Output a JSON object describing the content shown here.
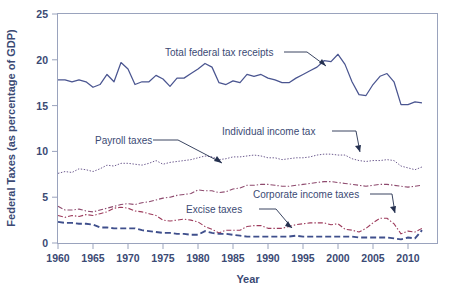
{
  "chart_data": {
    "type": "line",
    "title": "",
    "xlabel": "Year",
    "ylabel": "Federal Taxes (as percentage of GDP)",
    "xlim": [
      1960,
      2012
    ],
    "ylim": [
      0,
      25
    ],
    "xticks": [
      1960,
      1965,
      1970,
      1975,
      1980,
      1985,
      1990,
      1995,
      2000,
      2005,
      2010
    ],
    "yticks": [
      0,
      5,
      10,
      15,
      20,
      25
    ],
    "grid": false,
    "legend": "annotations-with-leader-lines",
    "x": [
      1960,
      1961,
      1962,
      1963,
      1964,
      1965,
      1966,
      1967,
      1968,
      1969,
      1970,
      1971,
      1972,
      1973,
      1974,
      1975,
      1976,
      1977,
      1978,
      1979,
      1980,
      1981,
      1982,
      1983,
      1984,
      1985,
      1986,
      1987,
      1988,
      1989,
      1990,
      1991,
      1992,
      1993,
      1994,
      1995,
      1996,
      1997,
      1998,
      1999,
      2000,
      2001,
      2002,
      2003,
      2004,
      2005,
      2006,
      2007,
      2008,
      2009,
      2010,
      2011,
      2012
    ],
    "series": [
      {
        "name": "Total federal tax receipts",
        "style": "solid",
        "color": "#4a5590",
        "values": [
          17.8,
          17.8,
          17.6,
          17.8,
          17.6,
          17.0,
          17.3,
          18.4,
          17.6,
          19.7,
          19.0,
          17.3,
          17.6,
          17.6,
          18.3,
          17.9,
          17.1,
          18.0,
          18.0,
          18.5,
          19.0,
          19.6,
          19.2,
          17.5,
          17.3,
          17.7,
          17.5,
          18.4,
          18.2,
          18.4,
          18.0,
          17.8,
          17.5,
          17.5,
          18.0,
          18.4,
          18.8,
          19.2,
          19.9,
          19.8,
          20.6,
          19.5,
          17.6,
          16.2,
          16.1,
          17.3,
          18.2,
          18.5,
          17.6,
          15.1,
          15.1,
          15.4,
          15.3
        ]
      },
      {
        "name": "Payroll taxes",
        "style": "dotted",
        "color": "#6d5b8f",
        "values": [
          7.6,
          7.8,
          7.7,
          8.1,
          8.0,
          7.8,
          8.1,
          8.5,
          8.4,
          8.7,
          8.7,
          8.6,
          8.5,
          8.7,
          9.0,
          8.6,
          8.8,
          8.9,
          9.0,
          9.1,
          9.3,
          9.5,
          9.4,
          9.1,
          9.2,
          9.4,
          9.4,
          9.5,
          9.6,
          9.5,
          9.3,
          9.3,
          9.1,
          9.2,
          9.3,
          9.3,
          9.4,
          9.6,
          9.7,
          9.7,
          9.6,
          9.6,
          9.2,
          9.0,
          8.9,
          9.0,
          9.0,
          9.1,
          9.0,
          8.4,
          8.2,
          8.0,
          8.3
        ],
        "note": "This is the upper dotted series; label 'Payroll taxes' points to it"
      },
      {
        "name": "Individual income tax",
        "style": "dashdot",
        "color": "#8e4a6e",
        "values": [
          4.0,
          3.6,
          3.6,
          3.7,
          3.5,
          3.4,
          3.6,
          3.8,
          4.0,
          4.2,
          4.3,
          4.2,
          4.4,
          4.5,
          4.7,
          4.9,
          5.0,
          5.2,
          5.3,
          5.4,
          5.8,
          5.7,
          5.7,
          5.5,
          5.6,
          5.9,
          6.0,
          6.3,
          6.3,
          6.4,
          6.4,
          6.3,
          6.2,
          6.2,
          6.3,
          6.4,
          6.5,
          6.6,
          6.7,
          6.7,
          6.6,
          6.5,
          6.4,
          6.3,
          6.2,
          6.3,
          6.4,
          6.4,
          6.3,
          6.2,
          6.1,
          6.2,
          6.3
        ],
        "note": "Rising dash-dot series reaching about 6.3 by 2012"
      },
      {
        "name": "Corporate income taxes",
        "style": "dashdot",
        "color": "#9d3b5c",
        "values": [
          3.0,
          2.8,
          3.0,
          2.9,
          3.1,
          3.0,
          3.2,
          3.4,
          3.8,
          3.9,
          3.8,
          3.5,
          3.4,
          3.2,
          3.0,
          2.5,
          2.4,
          2.5,
          2.6,
          2.5,
          2.3,
          1.8,
          1.5,
          1.1,
          1.4,
          1.4,
          1.4,
          1.8,
          1.9,
          1.9,
          1.6,
          1.6,
          1.6,
          1.8,
          2.0,
          2.1,
          2.2,
          2.2,
          2.2,
          2.0,
          2.1,
          1.5,
          1.4,
          1.2,
          1.6,
          2.2,
          2.7,
          2.7,
          2.1,
          1.0,
          1.3,
          1.2,
          1.6
        ],
        "note": "Declining dash-dot series labelled with a leader pointing near 2003-2005"
      },
      {
        "name": "Excise taxes",
        "style": "longdash",
        "color": "#3f4f8c",
        "values": [
          2.3,
          2.2,
          2.2,
          2.1,
          2.1,
          2.0,
          1.7,
          1.7,
          1.6,
          1.6,
          1.6,
          1.6,
          1.4,
          1.3,
          1.2,
          1.1,
          1.1,
          1.0,
          1.0,
          0.9,
          0.9,
          1.3,
          1.1,
          1.0,
          1.0,
          0.9,
          0.8,
          0.7,
          0.7,
          0.7,
          0.7,
          0.7,
          0.7,
          0.7,
          0.8,
          0.7,
          0.7,
          0.7,
          0.7,
          0.7,
          0.7,
          0.7,
          0.7,
          0.6,
          0.6,
          0.6,
          0.6,
          0.6,
          0.5,
          0.4,
          0.6,
          0.5,
          1.4
        ],
        "note": "Lowest long-dashed blue series"
      }
    ],
    "annotations": [
      {
        "label": "Total federal tax receipts",
        "points_to_year": 1977,
        "points_to_value": 17.8
      },
      {
        "label": "Payroll taxes",
        "points_to_year": 1981,
        "points_to_value": 9.4
      },
      {
        "label": "Individual income tax",
        "points_to_year": 1999,
        "points_to_value": 9.8
      },
      {
        "label": "Corporate income taxes",
        "points_to_year": 2004,
        "points_to_value": 1.8
      },
      {
        "label": "Excise taxes",
        "points_to_year": 1989,
        "points_to_value": 0.9
      }
    ]
  },
  "axes": {
    "y_title": "Federal Taxes (as percentage of GDP)",
    "x_title": "Year",
    "y_tick_labels": [
      "0",
      "5",
      "10",
      "15",
      "20",
      "25"
    ],
    "x_tick_labels": [
      "1960",
      "1965",
      "1970",
      "1975",
      "1980",
      "1985",
      "1990",
      "1995",
      "2000",
      "2005",
      "2010"
    ]
  },
  "annotations": {
    "total_federal": "Total federal tax receipts",
    "payroll": "Payroll taxes",
    "individual": "Individual income tax",
    "corporate": "Corporate income taxes",
    "excise": "Excise taxes"
  },
  "colors": {
    "text": "#3b4a74",
    "frame": "#9aa3bd",
    "total_federal": "#4a5590",
    "payroll": "#6d5b8f",
    "individual": "#8e4a6e",
    "corporate": "#9d3b5c",
    "excise": "#3f4f8c",
    "leader": "#24304f",
    "background": "#ffffff"
  }
}
